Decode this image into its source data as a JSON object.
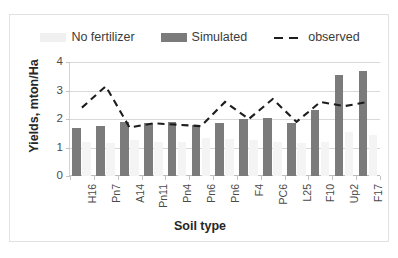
{
  "legend": {
    "items": [
      {
        "label": "No fertilizer",
        "type": "bar",
        "color": "#f0f0f0",
        "name": "legend-no-fertilizer"
      },
      {
        "label": "Simulated",
        "type": "bar",
        "color": "#7b7b7b",
        "name": "legend-simulated"
      },
      {
        "label": "observed",
        "type": "line",
        "color": "#1d1d1d",
        "name": "legend-observed"
      }
    ]
  },
  "chart_data": {
    "type": "bar",
    "title": "",
    "xlabel": "Soil type",
    "ylabel": "Yields, mton/Ha",
    "ylim": [
      0,
      4
    ],
    "yticks": [
      0,
      1,
      2,
      3,
      4
    ],
    "grid": true,
    "legend_position": "top",
    "categories": [
      "H16",
      "Pn7",
      "A14",
      "Pn11",
      "Pn4",
      "Pn6",
      "Pn6",
      "F4",
      "PC6",
      "L25",
      "F10",
      "Up2",
      "F17"
    ],
    "series": [
      {
        "name": "Simulated",
        "type": "bar",
        "color": "#7b7b7b",
        "values": [
          1.7,
          1.75,
          1.9,
          1.85,
          1.9,
          1.8,
          1.85,
          2.0,
          2.05,
          1.85,
          2.3,
          3.55,
          3.7
        ]
      },
      {
        "name": "No fertilizer",
        "type": "bar",
        "color": "#f0f0f0",
        "values": [
          1.2,
          1.15,
          1.25,
          1.2,
          1.2,
          1.35,
          1.3,
          1.25,
          1.2,
          1.15,
          1.2,
          1.55,
          1.45
        ]
      },
      {
        "name": "observed",
        "type": "line",
        "color": "#1d1d1d",
        "dashed": true,
        "values": [
          2.4,
          3.15,
          1.7,
          1.85,
          1.8,
          1.75,
          2.6,
          2.0,
          2.7,
          1.9,
          2.6,
          2.45,
          2.6
        ]
      }
    ]
  }
}
